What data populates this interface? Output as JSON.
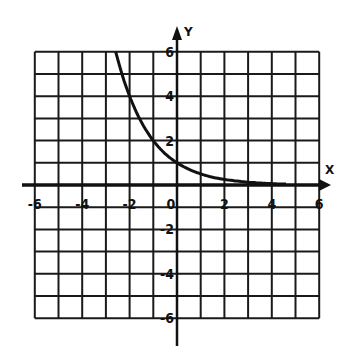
{
  "chart_data": {
    "type": "line",
    "title": "",
    "xlabel": "X",
    "ylabel": "Y",
    "xlim": [
      -6,
      6
    ],
    "ylim": [
      -6,
      6
    ],
    "grid": true,
    "grid_step": 1,
    "x_ticks": [
      -6,
      -4,
      -2,
      0,
      2,
      4,
      6
    ],
    "x_tick_labels": [
      "-6",
      "-4",
      "-2",
      "0",
      "2",
      "4",
      "6"
    ],
    "y_ticks": [
      6,
      4,
      2,
      -2,
      -4,
      -6
    ],
    "y_tick_labels": [
      "6",
      "4",
      "2",
      "-2",
      "-4",
      "-6"
    ],
    "series": [
      {
        "name": "y = (1/2)^x",
        "x": [
          -2.585,
          -2,
          -1.5,
          -1,
          -0.5,
          0,
          0.5,
          1,
          1.5,
          2,
          2.5,
          3,
          3.5,
          4,
          4.6
        ],
        "values": [
          6,
          4,
          2.83,
          2,
          1.41,
          1,
          0.71,
          0.5,
          0.35,
          0.25,
          0.18,
          0.125,
          0.09,
          0.06,
          0.04
        ]
      }
    ],
    "colors": {
      "grid": "#1a1a1a",
      "axis": "#111111",
      "curve": "#111111",
      "background": "#ffffff"
    }
  }
}
